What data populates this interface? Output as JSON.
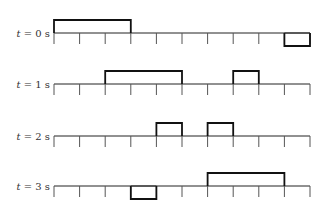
{
  "diagram": {
    "axis": {
      "x_start": 54,
      "tick_spacing": 25.6,
      "tick_count": 11,
      "tick_length": 11,
      "pulse_height": 13,
      "line_color": "#222222",
      "pulse_color": "#111111"
    },
    "rows": [
      {
        "label_var": "t",
        "label_eq": " = 0 s",
        "baseline_y": 33,
        "pulses": [
          {
            "start": 0,
            "end": 3,
            "direction": "up"
          },
          {
            "start": 9,
            "end": 10,
            "direction": "down"
          }
        ]
      },
      {
        "label_var": "t",
        "label_eq": " = 1 s",
        "baseline_y": 84,
        "pulses": [
          {
            "start": 2,
            "end": 5,
            "direction": "up"
          },
          {
            "start": 7,
            "end": 8,
            "direction": "up"
          }
        ]
      },
      {
        "label_var": "t",
        "label_eq": " = 2 s",
        "baseline_y": 136,
        "pulses": [
          {
            "start": 4,
            "end": 5,
            "direction": "up"
          },
          {
            "start": 6,
            "end": 7,
            "direction": "up"
          }
        ]
      },
      {
        "label_var": "t",
        "label_eq": " = 3 s",
        "baseline_y": 186,
        "pulses": [
          {
            "start": 3,
            "end": 4,
            "direction": "down"
          },
          {
            "start": 6,
            "end": 9,
            "direction": "up"
          }
        ]
      }
    ]
  }
}
